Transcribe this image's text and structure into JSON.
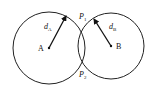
{
  "diagram": {
    "type": "two-intersecting-circles",
    "circles": [
      {
        "name": "A",
        "center_label": "A",
        "cx": 49,
        "cy": 48,
        "r": 36,
        "radius_label": "d",
        "radius_sub": "A"
      },
      {
        "name": "B",
        "center_label": "B",
        "cx": 111,
        "cy": 46,
        "r": 33,
        "radius_label": "d",
        "radius_sub": "B"
      }
    ],
    "intersections": [
      {
        "label": "P",
        "sub": "1"
      },
      {
        "label": "P",
        "sub": "2"
      }
    ],
    "stroke_color": "#222222",
    "background": "#ffffff"
  }
}
